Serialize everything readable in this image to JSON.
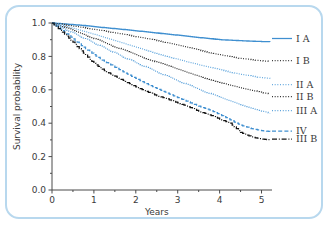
{
  "chart_data": {
    "type": "line",
    "title": "",
    "xlabel": "Years",
    "ylabel": "Survival probability",
    "xlim": [
      0,
      5.25
    ],
    "ylim": [
      0.0,
      1.0
    ],
    "xticks": [
      0,
      1,
      2,
      3,
      4,
      5
    ],
    "xtick_labels": [
      "0",
      "1",
      "2",
      "3",
      "4",
      "5"
    ],
    "yticks": [
      0.0,
      0.2,
      0.4,
      0.6,
      0.8,
      1.0
    ],
    "ytick_labels": [
      "0.0",
      "0.2",
      "0.4",
      "0.6",
      "0.8",
      "1.0"
    ],
    "grid": false,
    "legend_position": "right",
    "step_style": "kaplan-meier",
    "series": [
      {
        "name": "I A",
        "color": "#3f8fd0",
        "style": "solid",
        "x": [
          0,
          0.25,
          0.5,
          0.75,
          1.0,
          1.25,
          1.5,
          1.75,
          2.0,
          2.25,
          2.5,
          2.75,
          3.0,
          3.25,
          3.5,
          3.75,
          4.0,
          4.25,
          4.5,
          4.75,
          5.0,
          5.2
        ],
        "values": [
          1.0,
          0.995,
          0.99,
          0.985,
          0.978,
          0.972,
          0.966,
          0.96,
          0.953,
          0.947,
          0.94,
          0.933,
          0.927,
          0.92,
          0.913,
          0.907,
          0.9,
          0.897,
          0.894,
          0.891,
          0.889,
          0.888
        ]
      },
      {
        "name": "I B",
        "color": "#2b2b2b",
        "style": "dotted",
        "x": [
          0,
          0.25,
          0.5,
          0.75,
          1.0,
          1.25,
          1.5,
          1.75,
          2.0,
          2.25,
          2.5,
          2.75,
          3.0,
          3.25,
          3.5,
          3.75,
          4.0,
          4.25,
          4.5,
          4.75,
          5.0,
          5.2
        ],
        "values": [
          1.0,
          0.992,
          0.982,
          0.972,
          0.962,
          0.952,
          0.941,
          0.93,
          0.919,
          0.907,
          0.895,
          0.882,
          0.868,
          0.853,
          0.838,
          0.823,
          0.81,
          0.798,
          0.788,
          0.78,
          0.773,
          0.77
        ]
      },
      {
        "name": "II A",
        "color": "#5ba3dc",
        "style": "dotted",
        "x": [
          0,
          0.25,
          0.5,
          0.75,
          1.0,
          1.25,
          1.5,
          1.75,
          2.0,
          2.25,
          2.5,
          2.75,
          3.0,
          3.25,
          3.5,
          3.75,
          4.0,
          4.25,
          4.5,
          4.75,
          5.0,
          5.2
        ],
        "values": [
          1.0,
          0.985,
          0.968,
          0.95,
          0.932,
          0.913,
          0.894,
          0.875,
          0.856,
          0.837,
          0.818,
          0.8,
          0.783,
          0.766,
          0.75,
          0.735,
          0.72,
          0.706,
          0.693,
          0.682,
          0.673,
          0.668
        ]
      },
      {
        "name": "II B",
        "color": "#1f1f1f",
        "style": "dotted",
        "x": [
          0,
          0.25,
          0.5,
          0.75,
          1.0,
          1.25,
          1.5,
          1.75,
          2.0,
          2.25,
          2.5,
          2.75,
          3.0,
          3.25,
          3.5,
          3.75,
          4.0,
          4.25,
          4.5,
          4.75,
          5.0,
          5.2
        ],
        "values": [
          1.0,
          0.978,
          0.955,
          0.932,
          0.907,
          0.882,
          0.857,
          0.833,
          0.81,
          0.787,
          0.765,
          0.744,
          0.723,
          0.702,
          0.682,
          0.663,
          0.645,
          0.628,
          0.612,
          0.597,
          0.583,
          0.575
        ]
      },
      {
        "name": "III A",
        "color": "#4e9ad8",
        "style": "dotted",
        "x": [
          0,
          0.25,
          0.5,
          0.75,
          1.0,
          1.25,
          1.5,
          1.75,
          2.0,
          2.25,
          2.5,
          2.75,
          3.0,
          3.25,
          3.5,
          3.75,
          4.0,
          4.25,
          4.5,
          4.75,
          5.0,
          5.2
        ],
        "values": [
          1.0,
          0.97,
          0.94,
          0.91,
          0.88,
          0.85,
          0.82,
          0.79,
          0.762,
          0.734,
          0.707,
          0.68,
          0.654,
          0.628,
          0.603,
          0.578,
          0.555,
          0.533,
          0.512,
          0.492,
          0.473,
          0.46
        ]
      },
      {
        "name": "IV",
        "color": "#3f8fd0",
        "style": "dashed",
        "x": [
          0,
          0.25,
          0.5,
          0.75,
          1.0,
          1.25,
          1.5,
          1.75,
          2.0,
          2.25,
          2.5,
          2.75,
          3.0,
          3.25,
          3.5,
          3.75,
          4.0,
          4.25,
          4.5,
          4.75,
          5.0,
          5.2
        ],
        "values": [
          1.0,
          0.955,
          0.905,
          0.855,
          0.81,
          0.77,
          0.735,
          0.7,
          0.668,
          0.637,
          0.608,
          0.58,
          0.553,
          0.527,
          0.503,
          0.48,
          0.452,
          0.42,
          0.388,
          0.368,
          0.355,
          0.35
        ]
      },
      {
        "name": "III B",
        "color": "#141414",
        "style": "dashdot",
        "x": [
          0,
          0.25,
          0.5,
          0.75,
          1.0,
          1.25,
          1.5,
          1.75,
          2.0,
          2.25,
          2.5,
          2.75,
          3.0,
          3.25,
          3.5,
          3.75,
          4.0,
          4.25,
          4.5,
          4.75,
          5.0,
          5.2
        ],
        "values": [
          1.0,
          0.945,
          0.885,
          0.82,
          0.758,
          0.715,
          0.682,
          0.65,
          0.618,
          0.59,
          0.565,
          0.545,
          0.522,
          0.498,
          0.472,
          0.45,
          0.425,
          0.4,
          0.345,
          0.318,
          0.305,
          0.3
        ]
      }
    ],
    "legend": [
      {
        "label": "I A",
        "color": "#3f8fd0",
        "style": "solid"
      },
      {
        "label": "I B",
        "color": "#2b2b2b",
        "style": "dotted"
      },
      {
        "label": "II A",
        "color": "#5ba3dc",
        "style": "dotted"
      },
      {
        "label": "II B",
        "color": "#1f1f1f",
        "style": "dotted"
      },
      {
        "label": "III A",
        "color": "#4e9ad8",
        "style": "dotted"
      },
      {
        "label": "IV",
        "color": "#3f8fd0",
        "style": "dashed"
      },
      {
        "label": "III B",
        "color": "#141414",
        "style": "dashdot"
      }
    ]
  },
  "frame": {
    "border_color": "#b8d8ee",
    "background": "#ffffff"
  }
}
